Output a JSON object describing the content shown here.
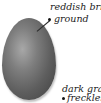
{
  "diagram": {
    "egg_color": "#6a6a6a",
    "labels": [
      {
        "line1": "reddish brick",
        "line2": "ground"
      },
      {
        "line1": "dark gray",
        "line2": "freckles"
      }
    ]
  }
}
